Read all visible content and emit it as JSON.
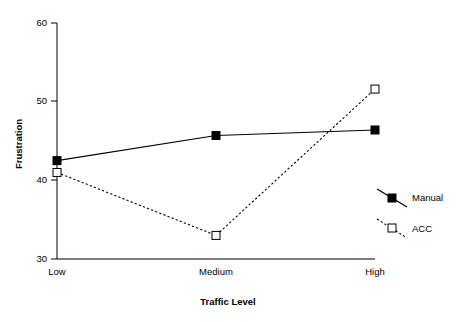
{
  "chart_data": {
    "type": "line",
    "title": "",
    "xlabel": "Traffic Level",
    "ylabel": "Frustration",
    "categories": [
      "Low",
      "Medium",
      "High"
    ],
    "yticks": [
      30,
      40,
      50,
      60
    ],
    "ylim": [
      28.5,
      60
    ],
    "grid": false,
    "legend_position": "right",
    "series": [
      {
        "name": "Manual",
        "values": [
          42.5,
          45.7,
          46.4
        ],
        "line_style": "solid",
        "marker": "filled-square",
        "color": "#000000"
      },
      {
        "name": "ACC",
        "values": [
          41.0,
          33.0,
          51.6
        ],
        "line_style": "dashed",
        "marker": "open-square",
        "color": "#000000"
      }
    ]
  },
  "axes": {
    "y_tick_labels": [
      "60",
      "50",
      "40",
      "30"
    ],
    "x_tick_labels": [
      "Low",
      "Medium",
      "High"
    ],
    "y_axis_title": "Frustration",
    "x_axis_title": "Traffic Level"
  },
  "legend": {
    "entries": [
      {
        "label": "Manual",
        "marker": "filled-square",
        "line_style": "solid"
      },
      {
        "label": "ACC",
        "marker": "open-square",
        "line_style": "dashed"
      }
    ]
  },
  "colors": {
    "foreground": "#000000",
    "background": "#ffffff"
  }
}
